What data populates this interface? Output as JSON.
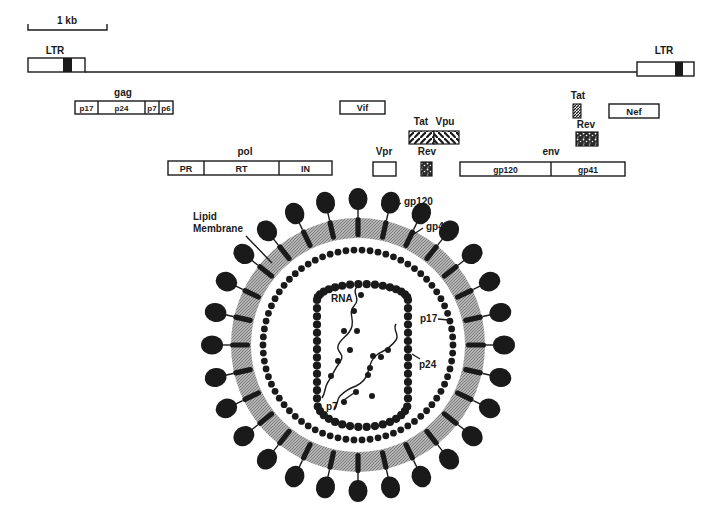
{
  "figure": {
    "background": "#ffffff",
    "ink": "#1a1a1a",
    "membrane_fill": "#9a9a9a"
  },
  "scale_bar": {
    "label": "1 kb"
  },
  "genome": {
    "ltr_left_label": "LTR",
    "ltr_right_label": "LTR"
  },
  "genes": {
    "gag": {
      "label": "gag",
      "segments": [
        "p17",
        "p24",
        "p7",
        "p6"
      ]
    },
    "pol": {
      "label": "pol",
      "segments": [
        "PR",
        "RT",
        "IN"
      ]
    },
    "vif": {
      "label": "Vif"
    },
    "vpr": {
      "label": "Vpr"
    },
    "tat_exon1": {
      "label": "Tat"
    },
    "vpu": {
      "label": "Vpu"
    },
    "rev_exon1": {
      "label": "Rev"
    },
    "env": {
      "label": "env",
      "segments": [
        "gp120",
        "gp41"
      ]
    },
    "tat_exon2": {
      "label": "Tat"
    },
    "rev_exon2": {
      "label": "Rev"
    },
    "nef": {
      "label": "Nef"
    }
  },
  "virion": {
    "labels": {
      "gp120": "gp120",
      "gp41": "gp41",
      "lipid_membrane_line1": "Lipid",
      "lipid_membrane_line2": "Membrane",
      "rna": "RNA",
      "p17": "p17",
      "p24": "p24",
      "p7": "p7"
    },
    "spike_count": 28
  }
}
